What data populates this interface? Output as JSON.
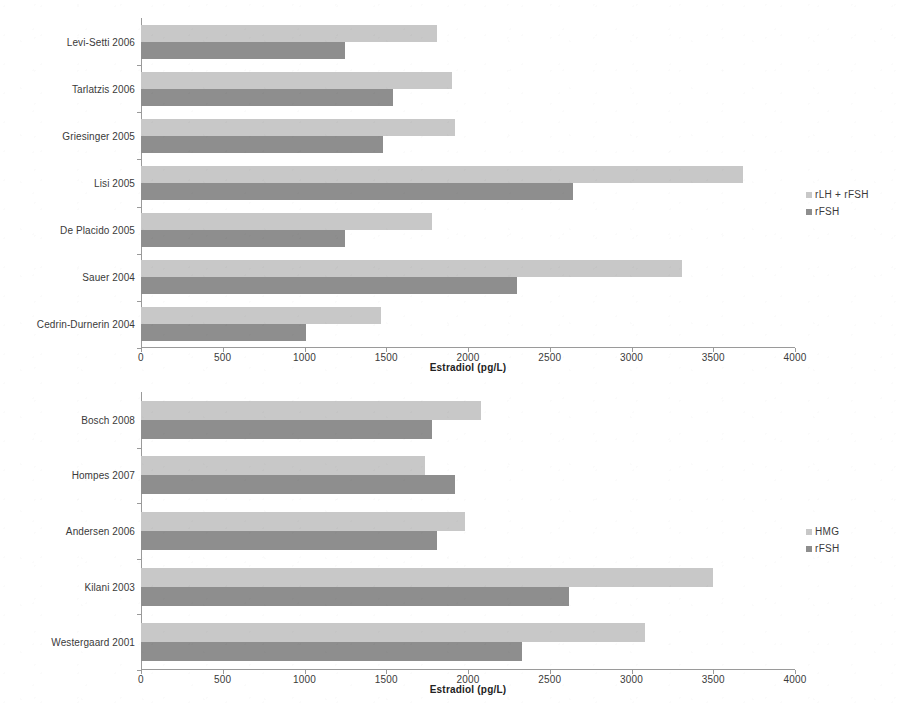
{
  "figure": {
    "background": "#ffffff",
    "colors": {
      "light_series": "#c8c8c8",
      "dark_series": "#8e8e8e",
      "axis": "#9a9a9a",
      "text": "#3a3a3a"
    }
  },
  "chart_data": [
    {
      "id": "top",
      "type": "bar",
      "orientation": "horizontal",
      "title": "",
      "xlabel": "Estradiol (pg/L)",
      "ylabel": "",
      "xlim": [
        0,
        4000
      ],
      "xticks": [
        0,
        500,
        1000,
        1500,
        2000,
        2500,
        3000,
        3500,
        4000
      ],
      "xticklabels": [
        "0",
        "500",
        "1000",
        "1500",
        "2000",
        "2500",
        "3000",
        "3500",
        "4000"
      ],
      "grid": false,
      "legend_position": "right",
      "categories": [
        "Levi-Setti 2006",
        "Tarlatzis 2006",
        "Griesinger 2005",
        "Lisi 2005",
        "De Placido 2005",
        "Sauer 2004",
        "Cedrin-Durnerin 2004"
      ],
      "series": [
        {
          "name": "rLH + rFSH",
          "color": "#c8c8c8",
          "values": [
            1810,
            1900,
            1920,
            3680,
            1780,
            3310,
            1470
          ]
        },
        {
          "name": "rFSH",
          "color": "#8e8e8e",
          "values": [
            1250,
            1540,
            1480,
            2640,
            1250,
            2300,
            1010
          ]
        }
      ]
    },
    {
      "id": "bottom",
      "type": "bar",
      "orientation": "horizontal",
      "title": "",
      "xlabel": "Estradiol (pg/L)",
      "ylabel": "",
      "xlim": [
        0,
        4000
      ],
      "xticks": [
        0,
        500,
        1000,
        1500,
        2000,
        2500,
        3000,
        3500,
        4000
      ],
      "xticklabels": [
        "0",
        "500",
        "1000",
        "1500",
        "2000",
        "2500",
        "3000",
        "3500",
        "4000"
      ],
      "grid": false,
      "legend_position": "right",
      "categories": [
        "Bosch 2008",
        "Hompes 2007",
        "Andersen 2006",
        "Kilani 2003",
        "Westergaard 2001"
      ],
      "series": [
        {
          "name": "HMG",
          "color": "#c8c8c8",
          "values": [
            2080,
            1740,
            1980,
            3500,
            3080
          ]
        },
        {
          "name": "rFSH",
          "color": "#8e8e8e",
          "values": [
            1780,
            1920,
            1810,
            2620,
            2330
          ]
        }
      ]
    }
  ]
}
